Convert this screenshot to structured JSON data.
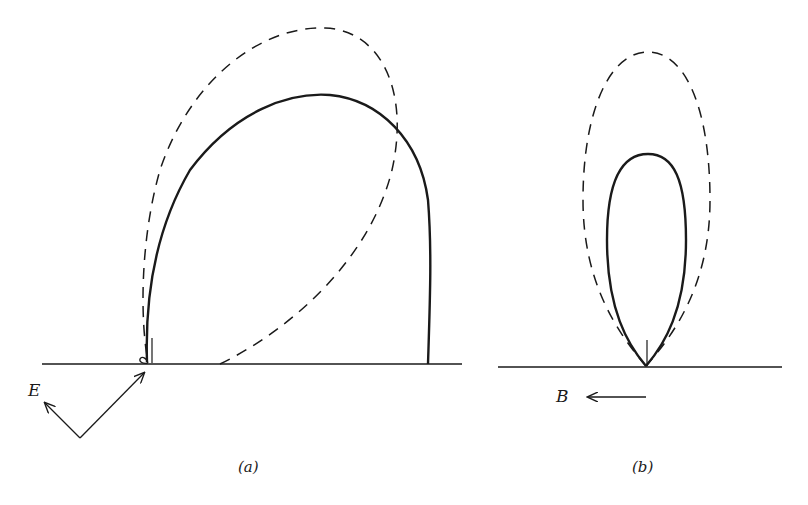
{
  "figure": {
    "panels": [
      {
        "id": "a",
        "caption": "(a)",
        "vector_label": "E",
        "curves": [
          {
            "style": "solid",
            "description": "tilted lobe extending up-right, ending vertically at baseline on right"
          },
          {
            "style": "dashed",
            "description": "tilted elliptical lobe leaning right"
          }
        ]
      },
      {
        "id": "b",
        "caption": "(b)",
        "vector_label": "B",
        "curves": [
          {
            "style": "solid",
            "description": "narrow vertical lobe"
          },
          {
            "style": "dashed",
            "description": "larger vertical elliptical lobe"
          }
        ]
      }
    ],
    "colors": {
      "ink": "#1a1a1a",
      "background": "#ffffff"
    }
  }
}
